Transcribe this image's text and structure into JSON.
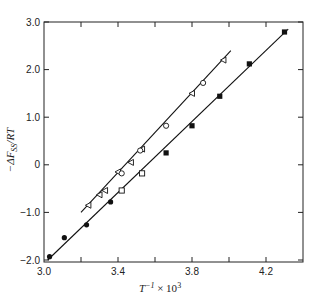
{
  "chart_data": {
    "type": "scatter",
    "title": "",
    "xlabel": "T^-1 × 10^3",
    "ylabel": "−ΔF_SS/RT",
    "xlim": [
      3.0,
      4.4
    ],
    "ylim": [
      -2.0,
      3.0
    ],
    "x_ticks": [
      3.0,
      3.4,
      3.8,
      4.2
    ],
    "x_tick_labels": [
      "3.0",
      "3.4",
      "3.8",
      "4.2"
    ],
    "x_minor_ticks": [
      3.2,
      3.6,
      4.0
    ],
    "y_ticks": [
      -2.0,
      -1.0,
      0,
      1.0,
      2.0,
      3.0
    ],
    "y_tick_labels": [
      "−2.0",
      "−1.0",
      "0",
      "1.0",
      "2.0",
      "3.0"
    ],
    "grid": false,
    "legend": null,
    "series": [
      {
        "name": "filled circles",
        "marker": "filled-circle",
        "x": [
          3.03,
          3.11,
          3.23,
          3.36
        ],
        "y": [
          -1.93,
          -1.53,
          -1.26,
          -0.78
        ]
      },
      {
        "name": "open squares",
        "marker": "open-square",
        "x": [
          3.42,
          3.53
        ],
        "y": [
          -0.54,
          -0.18
        ]
      },
      {
        "name": "filled squares",
        "marker": "filled-square",
        "x": [
          3.66,
          3.8,
          3.95,
          4.11,
          4.3
        ],
        "y": [
          0.25,
          0.82,
          1.44,
          2.12,
          2.79
        ]
      },
      {
        "name": "open triangles",
        "marker": "open-triangle",
        "x": [
          3.24,
          3.3,
          3.33,
          3.4,
          3.47,
          3.53,
          3.8,
          3.97
        ],
        "y": [
          -0.85,
          -0.63,
          -0.54,
          -0.15,
          0.05,
          0.33,
          1.5,
          2.2
        ]
      },
      {
        "name": "open circles",
        "marker": "open-circle",
        "x": [
          3.42,
          3.52,
          3.66,
          3.86
        ],
        "y": [
          -0.18,
          0.3,
          0.82,
          1.72
        ]
      }
    ],
    "fit_lines": [
      {
        "name": "upper fit (triangles/open circles)",
        "x": [
          3.2,
          4.01
        ],
        "y": [
          -1.0,
          2.4
        ]
      },
      {
        "name": "lower fit (circles/squares)",
        "x": [
          3.02,
          4.32
        ],
        "y": [
          -2.0,
          2.85
        ]
      }
    ]
  },
  "labels": {
    "xlabel_main": "T",
    "xlabel_sup": "−1",
    "xlabel_rest": " × 10",
    "xlabel_exp": "3",
    "ylabel_minus": "−ΔF",
    "ylabel_sub": "SS",
    "ylabel_rest": "/RT"
  }
}
